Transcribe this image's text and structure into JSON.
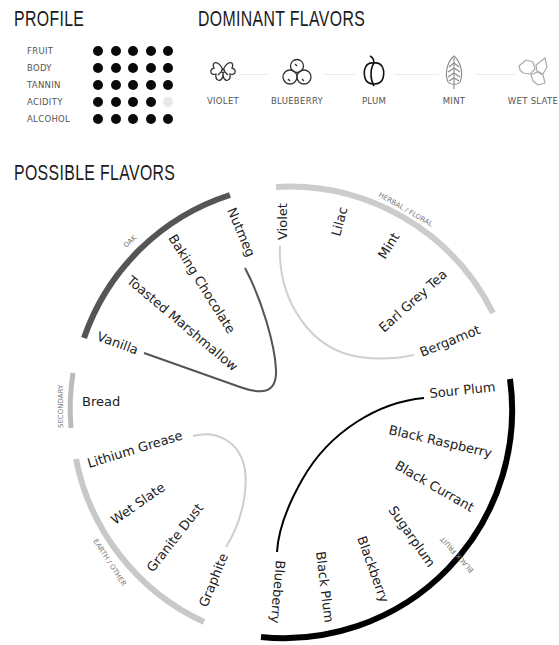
{
  "profile": {
    "title": "PROFILE",
    "rows": [
      {
        "label": "FRUIT",
        "filled": 5,
        "total": 5
      },
      {
        "label": "BODY",
        "filled": 5,
        "total": 5
      },
      {
        "label": "TANNIN",
        "filled": 5,
        "total": 5
      },
      {
        "label": "ACIDITY",
        "filled": 4,
        "total": 5
      },
      {
        "label": "ALCOHOL",
        "filled": 5,
        "total": 5
      }
    ]
  },
  "dominant": {
    "title": "DOMINANT FLAVORS",
    "items": [
      {
        "label": "VIOLET",
        "icon": "violet-flower-icon"
      },
      {
        "label": "BLUEBERRY",
        "icon": "blueberry-icon"
      },
      {
        "label": "PLUM",
        "icon": "plum-icon"
      },
      {
        "label": "MINT",
        "icon": "mint-leaf-icon"
      },
      {
        "label": "WET SLATE",
        "icon": "wet-slate-icon"
      }
    ]
  },
  "possible": {
    "title": "POSSIBLE FLAVORS",
    "groups": {
      "oak": {
        "label": "OAK",
        "color": "#555555",
        "flavors": [
          "Nutmeg",
          "Baking Chocolate",
          "Toasted Marshmallow",
          "Vanilla"
        ]
      },
      "herbal": {
        "label": "HERBAL / FLORAL",
        "color": "#cccccc",
        "flavors": [
          "Violet",
          "Lilac",
          "Mint",
          "Earl Grey Tea",
          "Bergamot"
        ]
      },
      "secondary": {
        "label": "SECONDARY",
        "color": "#bbbbbb",
        "flavors": [
          "Bread"
        ]
      },
      "earth": {
        "label": "EARTH / OTHER",
        "color": "#c8c8c8",
        "flavors": [
          "Lithium Grease",
          "Wet Slate",
          "Granite Dust",
          "Graphite"
        ]
      },
      "black_fruit": {
        "label": "BLACK FRUIT",
        "color": "#000000",
        "flavors": [
          "Sour Plum",
          "Black Raspberry",
          "Black Currant",
          "Sugarplum",
          "Blackberry",
          "Black Plum",
          "Blueberry"
        ]
      }
    }
  }
}
